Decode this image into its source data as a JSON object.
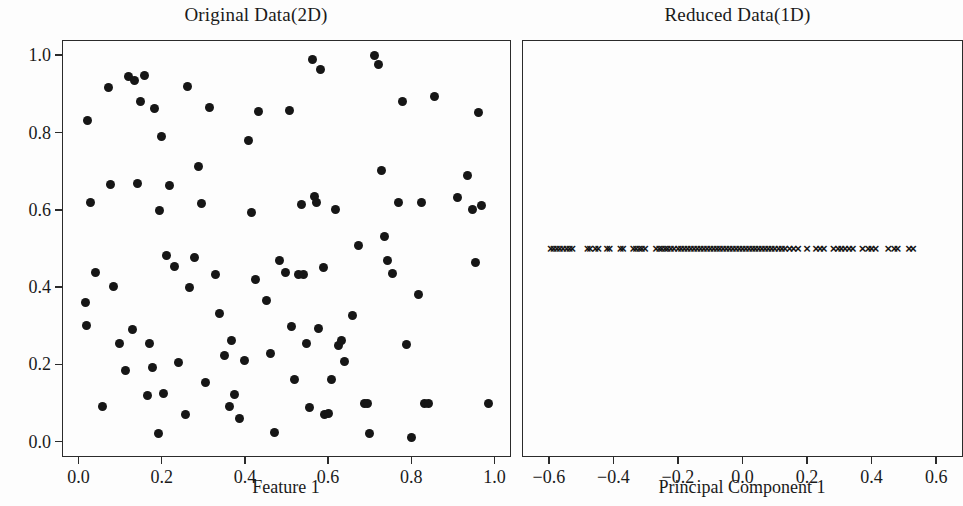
{
  "figure": {
    "background_color": "#fdfdfd",
    "marker_color": "#161616",
    "axis_color": "#2b2b2b"
  },
  "panels": [
    {
      "id": "original",
      "title": "Original Data(2D)",
      "xlabel": "Feature 1",
      "ylabel": "Feature 2",
      "xticks": [
        "0.0",
        "0.2",
        "0.4",
        "0.6",
        "0.8",
        "1.0"
      ],
      "yticks": [
        "0.0",
        "0.2",
        "0.4",
        "0.6",
        "0.8",
        "1.0"
      ]
    },
    {
      "id": "reduced",
      "title": "Reduced Data(1D)",
      "xlabel": "Principal Component 1",
      "ylabel": "",
      "xticks": [
        "−0.6",
        "−0.4",
        "−0.2",
        "0.0",
        "0.2",
        "0.4",
        "0.6"
      ],
      "yticks": []
    }
  ],
  "chart_data": [
    {
      "type": "scatter",
      "title": "Original Data(2D)",
      "xlabel": "Feature 1",
      "ylabel": "Feature 2",
      "xlim": [
        -0.037,
        1.037
      ],
      "ylim": [
        -0.037,
        1.037
      ],
      "xticks": [
        0.0,
        0.2,
        0.4,
        0.6,
        0.8,
        1.0
      ],
      "yticks": [
        0.0,
        0.2,
        0.4,
        0.6,
        0.8,
        1.0
      ],
      "grid": false,
      "legend": null,
      "marker": "circle",
      "marker_color": "#161616",
      "points": [
        [
          0.016,
          0.36
        ],
        [
          0.02,
          0.3
        ],
        [
          0.022,
          0.83
        ],
        [
          0.03,
          0.618
        ],
        [
          0.04,
          0.438
        ],
        [
          0.058,
          0.09
        ],
        [
          0.072,
          0.917
        ],
        [
          0.078,
          0.665
        ],
        [
          0.085,
          0.402
        ],
        [
          0.098,
          0.255
        ],
        [
          0.112,
          0.183
        ],
        [
          0.12,
          0.945
        ],
        [
          0.13,
          0.29
        ],
        [
          0.135,
          0.935
        ],
        [
          0.142,
          0.668
        ],
        [
          0.15,
          0.88
        ],
        [
          0.158,
          0.947
        ],
        [
          0.165,
          0.12
        ],
        [
          0.172,
          0.253
        ],
        [
          0.178,
          0.192
        ],
        [
          0.183,
          0.862
        ],
        [
          0.192,
          0.022
        ],
        [
          0.196,
          0.598
        ],
        [
          0.2,
          0.79
        ],
        [
          0.205,
          0.125
        ],
        [
          0.212,
          0.482
        ],
        [
          0.218,
          0.664
        ],
        [
          0.232,
          0.453
        ],
        [
          0.24,
          0.205
        ],
        [
          0.258,
          0.07
        ],
        [
          0.262,
          0.92
        ],
        [
          0.268,
          0.398
        ],
        [
          0.278,
          0.478
        ],
        [
          0.288,
          0.712
        ],
        [
          0.296,
          0.617
        ],
        [
          0.305,
          0.153
        ],
        [
          0.315,
          0.865
        ],
        [
          0.33,
          0.432
        ],
        [
          0.34,
          0.333
        ],
        [
          0.352,
          0.222
        ],
        [
          0.362,
          0.09
        ],
        [
          0.368,
          0.262
        ],
        [
          0.375,
          0.122
        ],
        [
          0.388,
          0.06
        ],
        [
          0.398,
          0.21
        ],
        [
          0.408,
          0.78
        ],
        [
          0.415,
          0.593
        ],
        [
          0.425,
          0.42
        ],
        [
          0.432,
          0.855
        ],
        [
          0.452,
          0.365
        ],
        [
          0.462,
          0.228
        ],
        [
          0.47,
          0.025
        ],
        [
          0.482,
          0.468
        ],
        [
          0.498,
          0.437
        ],
        [
          0.508,
          0.857
        ],
        [
          0.512,
          0.298
        ],
        [
          0.52,
          0.162
        ],
        [
          0.528,
          0.433
        ],
        [
          0.535,
          0.615
        ],
        [
          0.54,
          0.433
        ],
        [
          0.548,
          0.253
        ],
        [
          0.555,
          0.088
        ],
        [
          0.562,
          0.988
        ],
        [
          0.568,
          0.635
        ],
        [
          0.572,
          0.618
        ],
        [
          0.578,
          0.292
        ],
        [
          0.582,
          0.962
        ],
        [
          0.588,
          0.45
        ],
        [
          0.592,
          0.07
        ],
        [
          0.6,
          0.072
        ],
        [
          0.608,
          0.16
        ],
        [
          0.618,
          0.602
        ],
        [
          0.625,
          0.25
        ],
        [
          0.632,
          0.262
        ],
        [
          0.64,
          0.208
        ],
        [
          0.658,
          0.327
        ],
        [
          0.672,
          0.508
        ],
        [
          0.688,
          0.098
        ],
        [
          0.695,
          0.098
        ],
        [
          0.7,
          0.02
        ],
        [
          0.712,
          1.0
        ],
        [
          0.722,
          0.975
        ],
        [
          0.728,
          0.702
        ],
        [
          0.735,
          0.53
        ],
        [
          0.742,
          0.468
        ],
        [
          0.755,
          0.435
        ],
        [
          0.768,
          0.62
        ],
        [
          0.778,
          0.88
        ],
        [
          0.788,
          0.252
        ],
        [
          0.8,
          0.01
        ],
        [
          0.818,
          0.382
        ],
        [
          0.825,
          0.62
        ],
        [
          0.832,
          0.098
        ],
        [
          0.84,
          0.098
        ],
        [
          0.855,
          0.893
        ],
        [
          0.912,
          0.632
        ],
        [
          0.935,
          0.688
        ],
        [
          0.948,
          0.6
        ],
        [
          0.955,
          0.463
        ],
        [
          0.962,
          0.852
        ],
        [
          0.968,
          0.612
        ],
        [
          0.985,
          0.1
        ]
      ]
    },
    {
      "type": "scatter",
      "title": "Reduced Data(1D)",
      "xlabel": "Principal Component 1",
      "ylabel": "",
      "xlim": [
        -0.68,
        0.68
      ],
      "ylim": [
        -1.0,
        1.0
      ],
      "xticks": [
        -0.6,
        -0.4,
        -0.2,
        0.0,
        0.2,
        0.4,
        0.6
      ],
      "yticks": [],
      "grid": false,
      "legend": null,
      "marker": "x",
      "marker_color": "#161616",
      "y_constant": 0.0,
      "values": [
        -0.594,
        -0.585,
        -0.575,
        -0.566,
        -0.556,
        -0.545,
        -0.536,
        -0.527,
        -0.48,
        -0.472,
        -0.456,
        -0.447,
        -0.42,
        -0.412,
        -0.378,
        -0.37,
        -0.338,
        -0.33,
        -0.32,
        -0.312,
        -0.302,
        -0.268,
        -0.258,
        -0.25,
        -0.24,
        -0.232,
        -0.222,
        -0.212,
        -0.2,
        -0.19,
        -0.18,
        -0.17,
        -0.16,
        -0.15,
        -0.14,
        -0.13,
        -0.12,
        -0.11,
        -0.1,
        -0.09,
        -0.08,
        -0.07,
        -0.06,
        -0.05,
        -0.04,
        -0.03,
        -0.02,
        -0.01,
        0.0,
        0.01,
        0.02,
        0.03,
        0.04,
        0.05,
        0.06,
        0.07,
        0.08,
        0.09,
        0.1,
        0.112,
        0.122,
        0.132,
        0.146,
        0.158,
        0.172,
        0.2,
        0.228,
        0.24,
        0.252,
        0.282,
        0.296,
        0.306,
        0.318,
        0.33,
        0.342,
        0.372,
        0.39,
        0.4,
        0.412,
        0.452,
        0.47,
        0.48,
        0.516,
        0.528
      ]
    }
  ]
}
